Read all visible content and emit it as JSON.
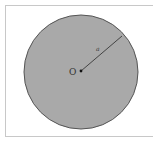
{
  "diagram": {
    "type": "circle-with-radius",
    "center_label": "O",
    "radius_label": "a",
    "circle_fill": "#a9a9a9",
    "circle_stroke": "#555555",
    "radius_line_color": "#444444",
    "frame_color": "#c8c8c8"
  }
}
